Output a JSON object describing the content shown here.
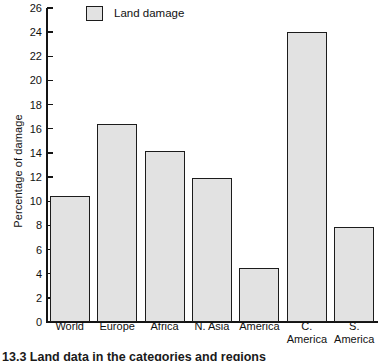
{
  "chart_data": {
    "type": "bar",
    "title": "",
    "xlabel": "",
    "ylabel": "Percentage of damage",
    "ylim": [
      0,
      26
    ],
    "ytick_step": 2,
    "yticks": [
      0,
      2,
      4,
      6,
      8,
      10,
      12,
      14,
      16,
      18,
      20,
      22,
      24,
      26
    ],
    "grid": false,
    "legend_position": "top-left",
    "legend": [
      "Land damage"
    ],
    "categories": [
      "World",
      "Europe",
      "Africa",
      "N. Asia",
      "America",
      "C.\nAmerica",
      "S.\nAmerica"
    ],
    "series": [
      {
        "name": "Land damage",
        "values": [
          10.4,
          16.4,
          14.2,
          11.9,
          4.5,
          24.0,
          7.9
        ]
      }
    ]
  },
  "legend": {
    "entries": [
      {
        "label": "Land damage",
        "swatch_color": "#e2e2e2",
        "swatch_border": "#1c1c1c"
      }
    ]
  },
  "axis": {
    "y_label": "Percentage of damage",
    "y_ticks": [
      "0",
      "2",
      "4",
      "6",
      "8",
      "10",
      "12",
      "14",
      "16",
      "18",
      "20",
      "22",
      "24",
      "26"
    ]
  },
  "caption": {
    "text": "13.3  Land data in the categories and regions"
  },
  "colors": {
    "bar_fill": "#e2e2e2",
    "bar_stroke": "#1c1c1c",
    "axis": "#141414",
    "text": "#111111",
    "background": "#ffffff"
  }
}
